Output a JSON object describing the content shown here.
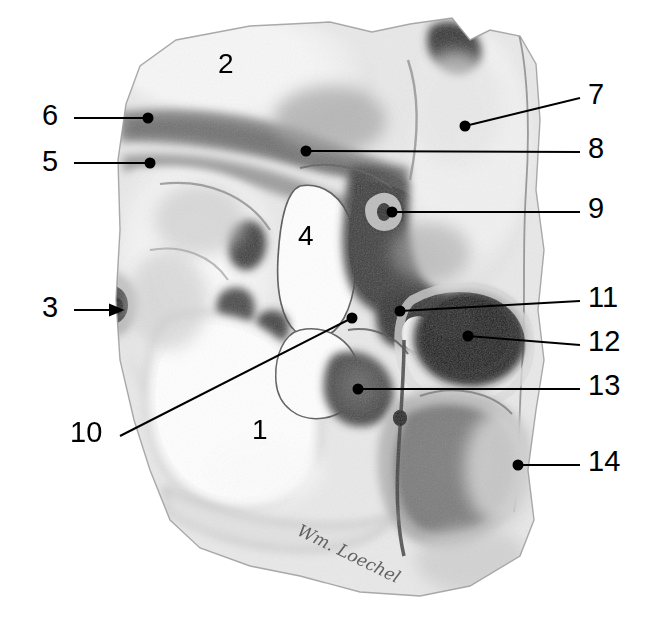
{
  "figure": {
    "artist_signature": "Wm. Loechel",
    "background_color": "#ffffff",
    "ink_color": "#000000",
    "width": 656,
    "height": 644
  },
  "labels": [
    {
      "id": "label-1",
      "text": "1",
      "x": 252,
      "y": 416,
      "kind": "inner",
      "leader": null
    },
    {
      "id": "label-2",
      "text": "2",
      "x": 218,
      "y": 50,
      "kind": "inner",
      "leader": null
    },
    {
      "id": "label-3",
      "text": "3",
      "x": 42,
      "y": 293,
      "kind": "outer",
      "leader": {
        "type": "arrow",
        "x1": 74,
        "y1": 310,
        "x2": 122,
        "y2": 310
      }
    },
    {
      "id": "label-4",
      "text": "4",
      "x": 298,
      "y": 222,
      "kind": "inner",
      "leader": null
    },
    {
      "id": "label-5",
      "text": "5",
      "x": 42,
      "y": 147,
      "kind": "outer",
      "leader": {
        "type": "dot",
        "x1": 74,
        "y1": 163,
        "x2": 150,
        "y2": 163
      }
    },
    {
      "id": "label-6",
      "text": "6",
      "x": 42,
      "y": 101,
      "kind": "outer",
      "leader": {
        "type": "dot",
        "x1": 74,
        "y1": 118,
        "x2": 148,
        "y2": 118
      }
    },
    {
      "id": "label-7",
      "text": "7",
      "x": 588,
      "y": 80,
      "kind": "outer",
      "leader": {
        "type": "dot",
        "x1": 580,
        "y1": 98,
        "x2": 465,
        "y2": 126
      }
    },
    {
      "id": "label-8",
      "text": "8",
      "x": 588,
      "y": 134,
      "kind": "outer",
      "leader": {
        "type": "dot",
        "x1": 580,
        "y1": 152,
        "x2": 306,
        "y2": 151
      }
    },
    {
      "id": "label-9",
      "text": "9",
      "x": 588,
      "y": 194,
      "kind": "outer",
      "leader": {
        "type": "dot",
        "x1": 580,
        "y1": 212,
        "x2": 392,
        "y2": 212
      }
    },
    {
      "id": "label-10",
      "text": "10",
      "x": 70,
      "y": 418,
      "kind": "outer",
      "leader": {
        "type": "dot",
        "x1": 120,
        "y1": 436,
        "x2": 352,
        "y2": 318
      }
    },
    {
      "id": "label-11",
      "text": "11",
      "x": 588,
      "y": 283,
      "kind": "outer",
      "leader": {
        "type": "dot",
        "x1": 580,
        "y1": 301,
        "x2": 400,
        "y2": 311
      }
    },
    {
      "id": "label-12",
      "text": "12",
      "x": 588,
      "y": 327,
      "kind": "outer",
      "leader": {
        "type": "dot",
        "x1": 580,
        "y1": 345,
        "x2": 468,
        "y2": 336
      }
    },
    {
      "id": "label-13",
      "text": "13",
      "x": 588,
      "y": 371,
      "kind": "outer",
      "leader": {
        "type": "dot",
        "x1": 580,
        "y1": 389,
        "x2": 358,
        "y2": 389
      }
    },
    {
      "id": "label-14",
      "text": "14",
      "x": 588,
      "y": 447,
      "kind": "outer",
      "leader": {
        "type": "dot",
        "x1": 580,
        "y1": 465,
        "x2": 518,
        "y2": 465
      }
    }
  ],
  "signature": {
    "text": "Wm. Loechel",
    "x": 303,
    "y": 520
  }
}
